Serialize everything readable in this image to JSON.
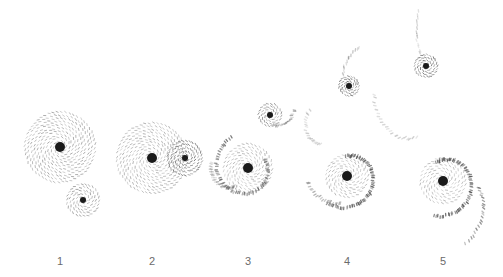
{
  "figure": {
    "panels": [
      {
        "label": "1",
        "x": 60,
        "primary": {
          "cx": 60,
          "cy": 147,
          "r": 35,
          "core": 5
        },
        "companion": {
          "cx": 83,
          "cy": 200,
          "r": 16,
          "core": 3
        },
        "stage": "approach"
      },
      {
        "label": "2",
        "x": 152,
        "primary": {
          "cx": 152,
          "cy": 158,
          "r": 35,
          "core": 5
        },
        "companion": {
          "cx": 185,
          "cy": 158,
          "r": 17,
          "core": 3
        },
        "stage": "encounter"
      },
      {
        "label": "3",
        "x": 248,
        "primary": {
          "cx": 248,
          "cy": 168,
          "r": 30,
          "core": 5
        },
        "companion": {
          "cx": 270,
          "cy": 115,
          "r": 14,
          "core": 3
        },
        "stage": "tidal-tails-forming"
      },
      {
        "label": "4",
        "x": 347,
        "primary": {
          "cx": 347,
          "cy": 176,
          "r": 28,
          "core": 5
        },
        "companion": {
          "cx": 349,
          "cy": 86,
          "r": 12,
          "core": 3
        },
        "stage": "spiral-arms"
      },
      {
        "label": "5",
        "x": 443,
        "primary": {
          "cx": 443,
          "cy": 181,
          "r": 30,
          "core": 5
        },
        "companion": {
          "cx": 426,
          "cy": 66,
          "r": 14,
          "core": 3
        },
        "stage": "separation"
      }
    ]
  },
  "colors": {
    "core": "#1a1a1a",
    "stars": "#555555",
    "label": "#6b6b6b",
    "background": "#ffffff"
  }
}
